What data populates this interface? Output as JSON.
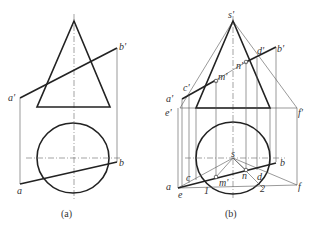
{
  "panels": [
    {
      "id": "a",
      "caption": "(a)",
      "labels": {
        "a_prime": "a'",
        "b_prime": "b'",
        "a": "a",
        "b": "b"
      }
    },
    {
      "id": "b",
      "caption": "(b)",
      "labels": {
        "s_prime": "s'",
        "d_prime": "d'",
        "b_prime": "b'",
        "n_prime": "n'",
        "m_prime": "m'",
        "c_prime": "c'",
        "a_prime": "a'",
        "e_prime": "e'",
        "f_prime": "f'",
        "s": "s",
        "b": "b",
        "c": "c",
        "a": "a",
        "e": "e",
        "m_prime_top": "m'",
        "n": "n",
        "d": "d",
        "f": "f",
        "one": "1",
        "two": "2"
      }
    }
  ]
}
